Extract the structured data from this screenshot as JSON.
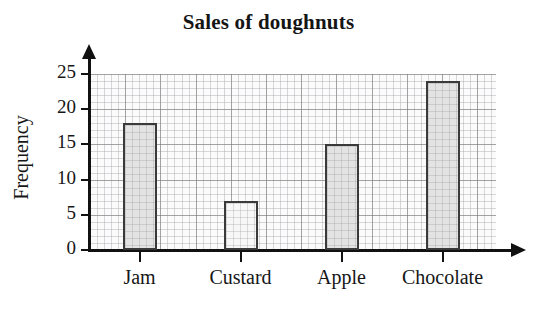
{
  "chart_data": {
    "type": "bar",
    "title": "Sales of doughnuts",
    "xlabel": "",
    "ylabel": "Frequency",
    "categories": [
      "Jam",
      "Custard",
      "Apple",
      "Chocolate"
    ],
    "values": [
      18,
      7,
      15,
      24
    ],
    "ylim": [
      0,
      25
    ],
    "ytick_labels": [
      "0",
      "5",
      "10",
      "15",
      "20",
      "25"
    ],
    "ytick_values": [
      0,
      5,
      10,
      15,
      20,
      25
    ],
    "grid": "graph-paper-minor-and-major",
    "legend": "none",
    "bar_colors": [
      "#e3e3e3",
      "#f7f7f7",
      "#e3e3e3",
      "#e3e3e3"
    ],
    "bar_edge_color": "#3a3a3a",
    "axis_color": "#111111",
    "background_color": "#ffffff"
  }
}
